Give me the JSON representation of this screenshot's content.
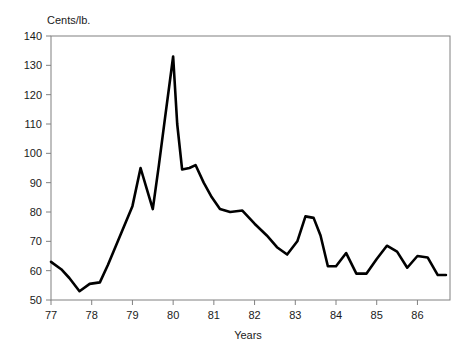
{
  "chart_data": {
    "type": "line",
    "title": "",
    "subtitle": "",
    "xlabel": "Years",
    "ylabel": "Cents/lb.",
    "ylabel_position": "top-left-inside",
    "xlim": [
      77,
      86.8
    ],
    "ylim": [
      50,
      140
    ],
    "yticks": [
      50,
      60,
      70,
      80,
      90,
      100,
      110,
      120,
      130,
      140
    ],
    "ytick_labels": [
      "50",
      "60",
      "70",
      "80",
      "90",
      "100",
      "110",
      "120",
      "130",
      "140"
    ],
    "xticks": [
      77,
      78,
      79,
      80,
      81,
      82,
      83,
      84,
      85,
      86
    ],
    "xtick_labels": [
      "77",
      "78",
      "79",
      "80",
      "81",
      "82",
      "83",
      "84",
      "85",
      "86"
    ],
    "grid": false,
    "legend": null,
    "annotations": [],
    "line_color": "#000000",
    "line_width": 2.6,
    "frame_color": "#808080",
    "background_color": "#ffffff",
    "series": [
      {
        "name": "Price",
        "x": [
          77.0,
          77.25,
          77.45,
          77.7,
          77.95,
          78.2,
          78.4,
          78.7,
          79.0,
          79.2,
          79.35,
          79.5,
          79.65,
          79.8,
          80.0,
          80.1,
          80.22,
          80.4,
          80.55,
          80.75,
          80.95,
          81.15,
          81.4,
          81.7,
          82.0,
          82.3,
          82.55,
          82.8,
          83.05,
          83.25,
          83.45,
          83.62,
          83.8,
          84.0,
          84.25,
          84.5,
          84.75,
          85.0,
          85.25,
          85.5,
          85.75,
          86.0,
          86.25,
          86.5,
          86.7
        ],
        "values": [
          63.0,
          60.5,
          57.5,
          53.0,
          55.5,
          56.0,
          62.0,
          72.0,
          82.0,
          95.0,
          88.0,
          81.0,
          96.0,
          112.0,
          133.0,
          110.0,
          94.5,
          95.0,
          96.0,
          90.0,
          85.0,
          81.0,
          80.0,
          80.5,
          76.0,
          72.0,
          68.0,
          65.5,
          70.0,
          78.5,
          78.0,
          72.0,
          61.5,
          61.5,
          66.0,
          59.0,
          59.0,
          64.0,
          68.5,
          66.5,
          61.0,
          65.0,
          64.5,
          58.5,
          58.5
        ]
      }
    ]
  }
}
